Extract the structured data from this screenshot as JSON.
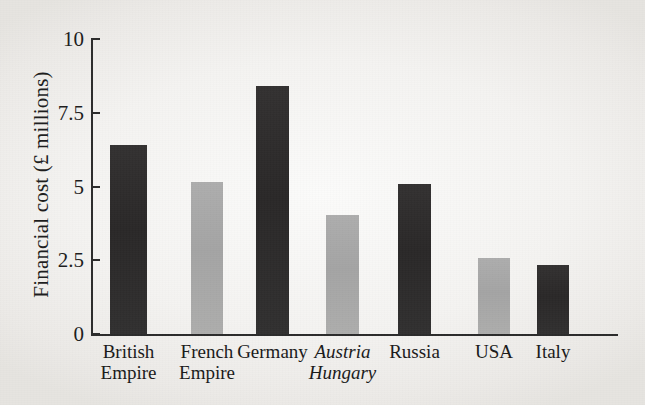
{
  "chart_data": {
    "type": "bar",
    "title": "",
    "xlabel": "",
    "ylabel": "Financial cost (£ millions)",
    "ylim": [
      0,
      10
    ],
    "yticks": [
      "0",
      "2.5",
      "5",
      "7.5",
      "10"
    ],
    "ytick_values": [
      0,
      2.5,
      5,
      7.5,
      10
    ],
    "grid": false,
    "legend": "none",
    "categories": [
      "British Empire",
      "French Empire",
      "Germany",
      "Austria Hungary",
      "Russia",
      "USA",
      "Italy"
    ],
    "category_lines": [
      [
        "British",
        "Empire"
      ],
      [
        "French",
        "Empire"
      ],
      [
        "Germany",
        ""
      ],
      [
        "Austria",
        "Hungary"
      ],
      [
        "Russia",
        ""
      ],
      [
        "USA",
        ""
      ],
      [
        "Italy",
        ""
      ]
    ],
    "values": [
      6.4,
      5.15,
      8.4,
      4.05,
      5.1,
      2.57,
      2.33
    ],
    "bar_colors": [
      "#2e2e2e",
      "#a8a8a8",
      "#2e2e2e",
      "#a8a8a8",
      "#2e2e2e",
      "#a8a8a8",
      "#2e2e2e"
    ],
    "bar_shades": [
      "dark",
      "light",
      "dark",
      "light",
      "dark",
      "light",
      "dark"
    ],
    "bar_x": [
      110,
      191,
      256,
      326,
      398,
      478,
      537
    ],
    "bar_width": [
      37,
      32,
      33,
      33,
      33,
      32,
      32
    ]
  },
  "axes": {
    "y_axis_color": "#2b2b2b",
    "x_axis_color": "#2b2b2b"
  },
  "style": {
    "background": "#f4f3f1",
    "text_color": "#1d1d1d"
  }
}
